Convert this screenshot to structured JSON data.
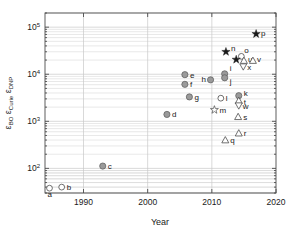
{
  "chart_data": {
    "type": "scatter",
    "title": "",
    "xlabel": "Year",
    "ylabel": "ε_DNP ε_Curie ε_BO",
    "ylabel_parts": {
      "p1_sym": "ε",
      "p1_sub": "DNP",
      "p2_sym": "ε",
      "p2_sub": "Curie",
      "p3_sym": "ε",
      "p3_sub": "BO"
    },
    "xlim": [
      1984,
      2020
    ],
    "ylim": [
      30,
      200000
    ],
    "yscale": "log",
    "xscale": "linear",
    "grid": true,
    "legend": "none",
    "xticks": [
      "1990",
      "2000",
      "2010",
      "2020"
    ],
    "xtick_values": [
      1990,
      2000,
      2010,
      2020
    ],
    "yticks": [
      "10²",
      "10³",
      "10⁴",
      "10⁵"
    ],
    "ytick_values": [
      100,
      1000,
      10000,
      100000
    ],
    "ytick_mantissa": "10",
    "ytick_exponents": [
      "2",
      "3",
      "4",
      "5"
    ],
    "points": [
      {
        "label": "a",
        "x": 1984.7,
        "y": 38,
        "marker": "open-circle",
        "lx": -2,
        "ly": 9
      },
      {
        "label": "b",
        "x": 1986.6,
        "y": 40,
        "marker": "open-circle",
        "lx": 5,
        "ly": 3
      },
      {
        "label": "c",
        "x": 1993.0,
        "y": 112,
        "marker": "filled-circle",
        "lx": 5,
        "ly": 3
      },
      {
        "label": "d",
        "x": 2003.0,
        "y": 1400,
        "marker": "filled-circle",
        "lx": 5,
        "ly": 3
      },
      {
        "label": "e",
        "x": 2005.8,
        "y": 9800,
        "marker": "filled-circle",
        "lx": 5,
        "ly": 3
      },
      {
        "label": "f",
        "x": 2005.8,
        "y": 6100,
        "marker": "filled-circle",
        "lx": 5,
        "ly": 3
      },
      {
        "label": "g",
        "x": 2006.5,
        "y": 3300,
        "marker": "filled-circle",
        "lx": 5,
        "ly": 3
      },
      {
        "label": "h",
        "x": 2009.8,
        "y": 7600,
        "marker": "filled-circle",
        "lx": -9,
        "ly": 2
      },
      {
        "label": "i",
        "x": 2012.0,
        "y": 10200,
        "marker": "filled-circle",
        "lx": 5,
        "ly": -3
      },
      {
        "label": "j",
        "x": 2012.0,
        "y": 8400,
        "marker": "filled-circle",
        "lx": 5,
        "ly": 6
      },
      {
        "label": "k",
        "x": 2014.2,
        "y": 3500,
        "marker": "filled-circle",
        "lx": 5,
        "ly": 0
      },
      {
        "label": "l",
        "x": 2011.4,
        "y": 3100,
        "marker": "open-circle",
        "lx": 5,
        "ly": 3
      },
      {
        "label": "m",
        "x": 2010.4,
        "y": 1750,
        "marker": "open-star",
        "lx": 5,
        "ly": 3
      },
      {
        "label": "n",
        "x": 2012.2,
        "y": 30000,
        "marker": "filled-star",
        "lx": 5,
        "ly": -1
      },
      {
        "label": "o",
        "x": 2014.6,
        "y": 24000,
        "marker": "open-circle",
        "lx": 3,
        "ly": -3
      },
      {
        "label": "p",
        "x": 2016.9,
        "y": 72000,
        "marker": "filled-star",
        "lx": 5,
        "ly": 2
      },
      {
        "label": "q",
        "x": 2012.1,
        "y": 400,
        "marker": "open-triangle",
        "lx": 5,
        "ly": 3
      },
      {
        "label": "r",
        "x": 2014.2,
        "y": 560,
        "marker": "open-triangle",
        "lx": 5,
        "ly": 3
      },
      {
        "label": "s",
        "x": 2014.1,
        "y": 1250,
        "marker": "open-triangle",
        "lx": 5,
        "ly": 3
      },
      {
        "label": "t",
        "x": 2014.2,
        "y": 2750,
        "marker": "open-triangle",
        "lx": 5,
        "ly": 4
      },
      {
        "label": "u",
        "x": 2015.0,
        "y": 19500,
        "marker": "open-triangle",
        "lx": 4,
        "ly": 1
      },
      {
        "label": "v",
        "x": 2016.4,
        "y": 19500,
        "marker": "open-triangle",
        "lx": 4,
        "ly": 1
      },
      {
        "label": "w",
        "x": 2014.2,
        "y": 2150,
        "marker": "open-dtriangle",
        "lx": 4,
        "ly": 3
      },
      {
        "label": "x",
        "x": 2014.9,
        "y": 14500,
        "marker": "open-dtriangle",
        "lx": 4,
        "ly": 3
      },
      {
        "label": "★n",
        "x": 2013.8,
        "y": 20500,
        "marker": "filled-star",
        "lx": 99,
        "ly": 99
      }
    ]
  }
}
